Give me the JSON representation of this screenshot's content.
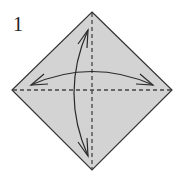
{
  "step": {
    "number": "1"
  },
  "paper": {
    "shape": "square-diamond",
    "fill": "#d3d3d3",
    "stroke": "#333333",
    "vertices": {
      "top": [
        92,
        12
      ],
      "right": [
        172,
        90
      ],
      "bottom": [
        92,
        170
      ],
      "left": [
        12,
        90
      ]
    }
  },
  "fold_lines": [
    {
      "name": "horizontal-diagonal",
      "style": "dashed",
      "from": [
        12,
        90
      ],
      "to": [
        172,
        90
      ]
    },
    {
      "name": "vertical-diagonal",
      "style": "dashed",
      "from": [
        92,
        12
      ],
      "to": [
        92,
        170
      ]
    }
  ],
  "arrows": [
    {
      "name": "horizontal-fold-arrow",
      "type": "double-headed-curved",
      "from": [
        31,
        85
      ],
      "to": [
        153,
        85
      ]
    },
    {
      "name": "vertical-fold-arrow",
      "type": "double-headed-curved",
      "from": [
        88,
        30
      ],
      "to": [
        88,
        156
      ]
    }
  ],
  "colors": {
    "line": "#2a2a2a",
    "dash": "#444444",
    "background": "#ffffff"
  }
}
